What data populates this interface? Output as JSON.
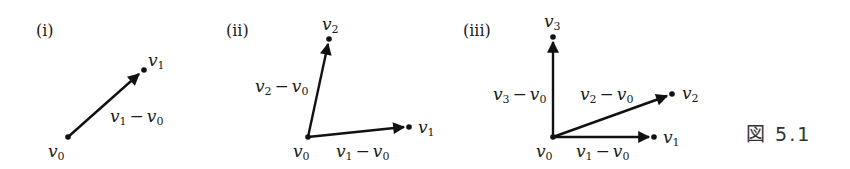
{
  "figure_caption": "図 5.1",
  "panels": [
    {
      "label": "(i)",
      "points": [
        {
          "name": "v0",
          "base": "v",
          "sub": "0"
        },
        {
          "name": "v1",
          "base": "v",
          "sub": "1"
        }
      ],
      "vectors": [
        {
          "from": "v0",
          "to": "v1",
          "label_base1": "v",
          "label_sub1": "1",
          "minus": "−",
          "label_base2": "v",
          "label_sub2": "0"
        }
      ]
    },
    {
      "label": "(ii)",
      "points": [
        {
          "name": "v0",
          "base": "v",
          "sub": "0"
        },
        {
          "name": "v1",
          "base": "v",
          "sub": "1"
        },
        {
          "name": "v2",
          "base": "v",
          "sub": "2"
        }
      ],
      "vectors": [
        {
          "from": "v0",
          "to": "v2",
          "label_base1": "v",
          "label_sub1": "2",
          "minus": "−",
          "label_base2": "v",
          "label_sub2": "0"
        },
        {
          "from": "v0",
          "to": "v1",
          "label_base1": "v",
          "label_sub1": "1",
          "minus": "−",
          "label_base2": "v",
          "label_sub2": "0"
        }
      ]
    },
    {
      "label": "(iii)",
      "points": [
        {
          "name": "v0",
          "base": "v",
          "sub": "0"
        },
        {
          "name": "v1",
          "base": "v",
          "sub": "1"
        },
        {
          "name": "v2",
          "base": "v",
          "sub": "2"
        },
        {
          "name": "v3",
          "base": "v",
          "sub": "3"
        }
      ],
      "vectors": [
        {
          "from": "v0",
          "to": "v3",
          "label_base1": "v",
          "label_sub1": "3",
          "minus": "−",
          "label_base2": "v",
          "label_sub2": "0"
        },
        {
          "from": "v0",
          "to": "v2",
          "label_base1": "v",
          "label_sub1": "2",
          "minus": "−",
          "label_base2": "v",
          "label_sub2": "0"
        },
        {
          "from": "v0",
          "to": "v1",
          "label_base1": "v",
          "label_sub1": "1",
          "minus": "−",
          "label_base2": "v",
          "label_sub2": "0"
        }
      ]
    }
  ]
}
